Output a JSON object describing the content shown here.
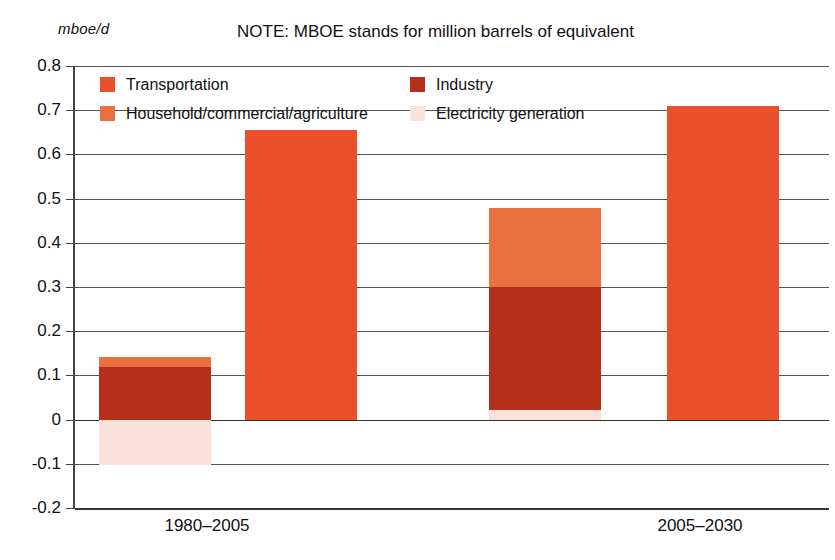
{
  "unit_label": "mboe/d",
  "note": "NOTE: MBOE stands for million barrels of equivalent",
  "legend": {
    "items": [
      {
        "label": "Transportation",
        "color": "#E8512B"
      },
      {
        "label": "Industry",
        "color": "#B5301A"
      },
      {
        "label": "Household/commercial/agriculture",
        "color": "#E8713F"
      },
      {
        "label": "Electricity generation",
        "color": "#FAE2DA"
      }
    ]
  },
  "chart_data": {
    "type": "bar",
    "title": "NOTE: MBOE stands for million barrels of equivalent",
    "xlabel": "",
    "ylabel": "mboe/d",
    "ylim": [
      -0.2,
      0.8
    ],
    "yticks": [
      "0.8",
      "0.7",
      "0.6",
      "0.5",
      "0.4",
      "0.3",
      "0.2",
      "0.1",
      "0",
      "-0.1",
      "-0.2"
    ],
    "ytick_values": [
      0.8,
      0.7,
      0.6,
      0.5,
      0.4,
      0.3,
      0.2,
      0.1,
      0,
      -0.1,
      -0.2
    ],
    "grid": true,
    "legend_position": "inside-top",
    "categories": [
      "1980–2005",
      "2005–2030"
    ],
    "groups": [
      {
        "category": "1980–2005",
        "bars": [
          {
            "name": "sectors-stacked",
            "stacked": true,
            "segments": [
              {
                "series": "Household/commercial/agriculture",
                "from": 0.12,
                "to": 0.142,
                "value": 0.022,
                "color": "#E8713F"
              },
              {
                "series": "Industry",
                "from": 0.0,
                "to": 0.12,
                "value": 0.12,
                "color": "#B5301A"
              },
              {
                "series": "Electricity generation",
                "from": -0.103,
                "to": 0.0,
                "value": -0.103,
                "color": "#FAE2DA"
              }
            ]
          },
          {
            "name": "transportation",
            "stacked": false,
            "segments": [
              {
                "series": "Transportation",
                "from": 0.0,
                "to": 0.655,
                "value": 0.655,
                "color": "#E8512B"
              }
            ]
          }
        ]
      },
      {
        "category": "2005–2030",
        "bars": [
          {
            "name": "sectors-stacked",
            "stacked": true,
            "segments": [
              {
                "series": "Household/commercial/agriculture",
                "from": 0.3,
                "to": 0.478,
                "value": 0.178,
                "color": "#E8713F"
              },
              {
                "series": "Industry",
                "from": 0.022,
                "to": 0.3,
                "value": 0.278,
                "color": "#B5301A"
              },
              {
                "series": "Electricity generation",
                "from": 0.0,
                "to": 0.022,
                "value": 0.022,
                "color": "#FAE2DA"
              }
            ]
          },
          {
            "name": "transportation",
            "stacked": false,
            "segments": [
              {
                "series": "Transportation",
                "from": 0.0,
                "to": 0.71,
                "value": 0.71,
                "color": "#E8512B"
              }
            ]
          }
        ]
      }
    ],
    "series": [
      {
        "name": "Transportation",
        "values": [
          0.655,
          0.71
        ]
      },
      {
        "name": "Household/commercial/agriculture",
        "values": [
          0.022,
          0.178
        ]
      },
      {
        "name": "Industry",
        "values": [
          0.12,
          0.278
        ]
      },
      {
        "name": "Electricity generation",
        "values": [
          -0.103,
          0.022
        ]
      }
    ]
  },
  "layout": {
    "bar_geometry": [
      {
        "group": 0,
        "bar": 0,
        "left": 24,
        "width": 112
      },
      {
        "group": 0,
        "bar": 1,
        "left": 170,
        "width": 112
      },
      {
        "group": 1,
        "bar": 0,
        "left": 414,
        "width": 112
      },
      {
        "group": 1,
        "bar": 1,
        "left": 592,
        "width": 112
      }
    ],
    "xlabel_x": [
      207,
      700
    ]
  }
}
